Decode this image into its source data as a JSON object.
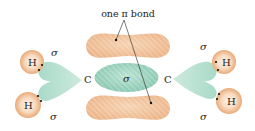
{
  "diagram": {
    "annotation": {
      "label": "one π bond"
    },
    "carbon_left": {
      "symbol": "C"
    },
    "carbon_right": {
      "symbol": "C"
    },
    "cc_sigma": {
      "label": "σ"
    },
    "hydrogens": [
      {
        "symbol": "H",
        "position": "left-top"
      },
      {
        "symbol": "H",
        "position": "left-bottom"
      },
      {
        "symbol": "H",
        "position": "right-top"
      },
      {
        "symbol": "H",
        "position": "right-bottom"
      }
    ],
    "ch_sigma_labels": [
      {
        "label": "σ",
        "position": "left-top"
      },
      {
        "label": "σ",
        "position": "left-bottom"
      },
      {
        "label": "σ",
        "position": "right-top"
      },
      {
        "label": "σ",
        "position": "right-bottom"
      }
    ],
    "colors": {
      "pi_lobe": "#f2c49a",
      "pi_lobe_edge": "#e8ad7c",
      "sigma_orbital": "#9fd4c0",
      "sigma_orbital_dark": "#7fbfa8",
      "hydrogen": "#f0b886",
      "hydrogen_core": "#fbe9da",
      "text": "#222222"
    }
  }
}
